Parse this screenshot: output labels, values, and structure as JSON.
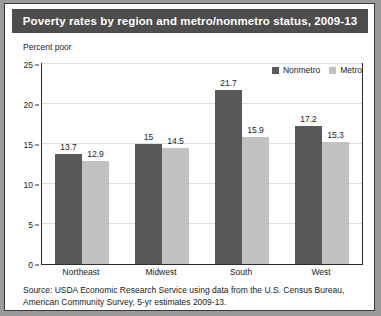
{
  "figure": {
    "title": "Poverty rates by region and metro/nonmetro status, 2009-13",
    "y_caption": "Percent poor",
    "source_line_1": "Source: USDA Economic Research Service using data from the U.S. Census Bureau,",
    "source_line_2": "American Community Survey, 5-yr estimates 2009-13."
  },
  "colors": {
    "nonmetro": "#595959",
    "metro": "#c2c2c2",
    "title_bar": "#4d4d4d",
    "title_text": "#ffffff",
    "gridline": "#dedede",
    "frame": "#2b2b2b"
  },
  "legend": {
    "position": "top-right",
    "entries": [
      {
        "label": "Nonmetro",
        "color": "#595959"
      },
      {
        "label": "Metro",
        "color": "#c2c2c2"
      }
    ]
  },
  "chart_data": {
    "type": "bar",
    "title": "Poverty rates by region and metro/nonmetro status, 2009-13",
    "subtitle": "",
    "xlabel": "",
    "ylabel": "Percent poor",
    "ylim": [
      0,
      25
    ],
    "yticks": [
      0,
      5,
      10,
      15,
      20,
      25
    ],
    "ytick_labels": [
      "0",
      "5",
      "10",
      "15",
      "20",
      "25"
    ],
    "grid": true,
    "legend_position": "top-right",
    "categories": [
      "Northeast",
      "Midwest",
      "South",
      "West"
    ],
    "series": [
      {
        "name": "Nonmetro",
        "color": "#595959",
        "values": [
          13.7,
          15,
          21.7,
          17.2
        ],
        "data_labels": [
          "13.7",
          "15",
          "21.7",
          "17.2"
        ]
      },
      {
        "name": "Metro",
        "color": "#c2c2c2",
        "values": [
          12.9,
          14.5,
          15.9,
          15.3
        ],
        "data_labels": [
          "12.9",
          "14.5",
          "15.9",
          "15.3"
        ]
      }
    ],
    "annotations": [
      "Source: USDA Economic Research Service using data from the U.S. Census Bureau,",
      "American Community Survey, 5-yr estimates 2009-13."
    ]
  }
}
